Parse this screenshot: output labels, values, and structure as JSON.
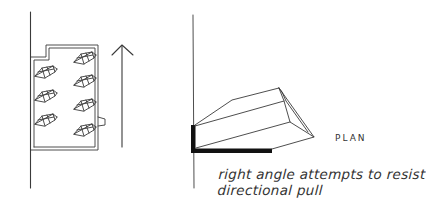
{
  "diagram": {
    "left_figure": {
      "description": "floor plan of a room with two columns of angled fixtures and an upward direction arrow",
      "fixtures_left_column": 3,
      "fixtures_right_column": 4,
      "arrow_direction": "up"
    },
    "right_figure": {
      "description": "single angled fixture in plan against a wall with a black right-angle bracket",
      "plan_label": "PLAN",
      "caption_line_1": "right angle attempts to resist",
      "caption_line_2": "directional pull"
    },
    "colors": {
      "ink": "#3a3a3a",
      "bracket": "#111111",
      "background": "#ffffff"
    }
  }
}
